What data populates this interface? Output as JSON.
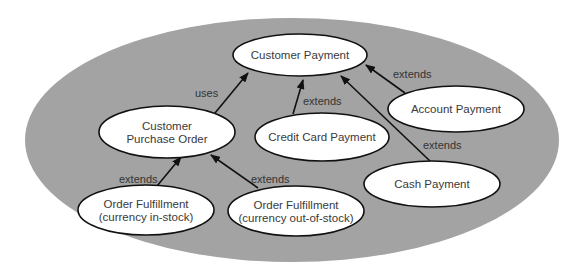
{
  "diagram": {
    "type": "uml-use-case",
    "system_boundary": {
      "shape": "ellipse",
      "cx": 292,
      "cy": 140,
      "rx": 267,
      "ry": 122,
      "color": "#a3a3a3"
    },
    "nodes": [
      {
        "id": "customer_payment",
        "lines": [
          "Customer Payment"
        ],
        "cx": 300,
        "cy": 55,
        "rx": 67,
        "ry": 21
      },
      {
        "id": "customer_purchase_order",
        "lines": [
          "Customer",
          "Purchase Order"
        ],
        "cx": 167,
        "cy": 132,
        "rx": 68,
        "ry": 26
      },
      {
        "id": "credit_card_payment",
        "lines": [
          "Credit Card Payment"
        ],
        "cx": 322,
        "cy": 137,
        "rx": 67,
        "ry": 24
      },
      {
        "id": "account_payment",
        "lines": [
          "Account Payment"
        ],
        "cx": 456,
        "cy": 109,
        "rx": 68,
        "ry": 23
      },
      {
        "id": "cash_payment",
        "lines": [
          "Cash Payment"
        ],
        "cx": 432,
        "cy": 184,
        "rx": 68,
        "ry": 23
      },
      {
        "id": "order_fulfillment_in_stock",
        "lines": [
          "Order Fulfillment",
          "(currency in-stock)"
        ],
        "cx": 146,
        "cy": 210,
        "rx": 68,
        "ry": 25
      },
      {
        "id": "order_fulfillment_out_of_stock",
        "lines": [
          "Order Fulfillment",
          "(currency out-of-stock)"
        ],
        "cx": 296,
        "cy": 211,
        "rx": 68,
        "ry": 25
      }
    ],
    "edges": [
      {
        "from": "customer_purchase_order",
        "to": "customer_payment",
        "label": "uses",
        "x1": 215,
        "y1": 113,
        "x2": 248,
        "y2": 73,
        "lx": 195,
        "ly": 97
      },
      {
        "from": "credit_card_payment",
        "to": "customer_payment",
        "label": "extends",
        "x1": 293,
        "y1": 114,
        "x2": 303,
        "y2": 80,
        "lx": 303,
        "ly": 105
      },
      {
        "from": "account_payment",
        "to": "customer_payment",
        "label": "extends",
        "x1": 405,
        "y1": 93,
        "x2": 366,
        "y2": 65,
        "lx": 393,
        "ly": 78
      },
      {
        "from": "cash_payment",
        "to": "customer_payment",
        "label": "extends",
        "x1": 430,
        "y1": 161,
        "x2": 341,
        "y2": 76,
        "lx": 423,
        "ly": 149
      },
      {
        "from": "order_fulfillment_in_stock",
        "to": "customer_purchase_order",
        "label": "extends",
        "x1": 157,
        "y1": 186,
        "x2": 181,
        "y2": 157,
        "lx": 119,
        "ly": 183
      },
      {
        "from": "order_fulfillment_out_of_stock",
        "to": "customer_purchase_order",
        "label": "extends",
        "x1": 258,
        "y1": 188,
        "x2": 211,
        "y2": 155,
        "lx": 251,
        "ly": 183
      }
    ]
  }
}
